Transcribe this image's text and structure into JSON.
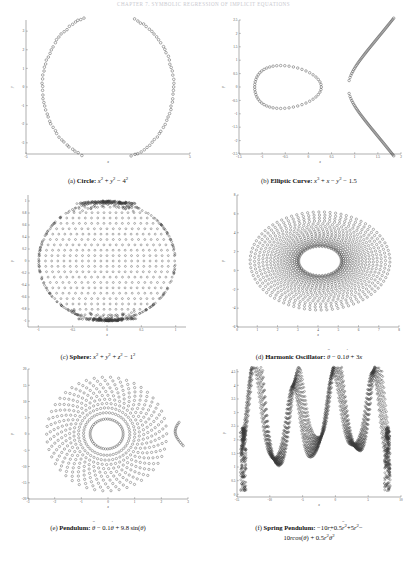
{
  "header": {
    "running_head": "CHAPTER 7. SYMBOLIC REGRESSION OF IMPLICIT EQUATIONS"
  },
  "figure": {
    "panels": [
      {
        "id": "a",
        "tag": "(a)",
        "name": "Circle",
        "equation_plain": "x^2 + y^2 - 4^2",
        "caption": "(a) Circle: x2 + y2 - 42",
        "xlabel": "x",
        "ylabel": "y"
      },
      {
        "id": "b",
        "tag": "(b)",
        "name": "Elliptic Curve",
        "equation_plain": "x^3 + x - y^2 - 1.5",
        "caption": "(b) Elliptic Curve: x3 + x - y2 - 1.5",
        "xlabel": "x",
        "ylabel": "y"
      },
      {
        "id": "c",
        "tag": "(c)",
        "name": "Sphere",
        "equation_plain": "x^2 + y^2 + z^2 - 1^2",
        "caption": "(c) Sphere: x2 + y2 + z2 - 12",
        "xlabel": "x",
        "ylabel": "y"
      },
      {
        "id": "d",
        "tag": "(d)",
        "name": "Harmonic Oscillator",
        "equation_plain": "theta-ddot - 0.1 theta-dot + 3x",
        "caption": "(d) Harmonic Oscillator: θ̈ - 0.1θ̇ + 3x",
        "xlabel": "x",
        "ylabel": "y"
      },
      {
        "id": "e",
        "tag": "(e)",
        "name": "Pendulum",
        "equation_plain": "theta-ddot - 0.1 theta-dot + 9.8 sin(theta)",
        "caption": "(e) Pendulum: θ̈ - 0.1θ̇ + 9.8 sin(θ)",
        "xlabel": "x",
        "ylabel": "y"
      },
      {
        "id": "f",
        "tag": "(f)",
        "name": "Spring Pendulum",
        "equation_plain": "-10r + 0.5 r-ddot^2 + 5r^2 - 10r cos(theta) + 0.5 r^2 theta-dot^2",
        "caption": "(f) Spring Pendulum: -10r + 0.5r̈2 + 5r2 - 10r cos(θ) + 0.5r2θ̇2",
        "xlabel": "x",
        "ylabel": "y"
      }
    ]
  },
  "style": {
    "marker_stroke": "#3a3a3a",
    "axis_color": "#7a7a7a",
    "tick_label_color": "#4a4a4a",
    "header_color": "#c9c9cf",
    "marker_radius": 1.35,
    "marker_stroke_width": 0.42
  },
  "chart_data": [
    {
      "panel": "a",
      "type": "scatter",
      "title": "Circle",
      "equation": "x^2 + y^2 - 4^2 = 0",
      "xlabel": "x",
      "ylabel": "y",
      "xlim": [
        -5,
        5
      ],
      "ylim": [
        -3.6,
        3.6
      ],
      "xticks": [
        -5,
        5
      ],
      "yticks": [
        -3,
        -2,
        -1,
        0,
        1,
        2,
        3
      ],
      "xticklabels": [
        "-5",
        "5"
      ],
      "yticklabels": [
        "-3",
        "-2",
        "-1",
        "0",
        "1",
        "2",
        "3"
      ],
      "grid": false,
      "legend": false,
      "generator": {
        "kind": "circle_ring",
        "radius": 4.0,
        "center": [
          0,
          0
        ],
        "n_points": 120,
        "noise": 0.035
      },
      "description": "Open-circle markers evenly distributed around a circle of radius 4 centred at the origin; top and bottom of the circle are clipped by the y-range so the ring appears as an arc-capped loop."
    },
    {
      "panel": "b",
      "type": "scatter",
      "title": "Elliptic Curve",
      "equation": "x^3 + x - y^2 - 1.5 = 0",
      "xlabel": "x",
      "ylabel": "y",
      "xlim": [
        -1.5,
        2
      ],
      "ylim": [
        -2.5,
        2.5
      ],
      "xticks": [
        -1.5,
        -1,
        -0.5,
        0,
        0.5,
        1,
        1.5,
        2
      ],
      "yticks": [
        -2.5,
        -2,
        -1.5,
        -1,
        -0.5,
        0,
        0.5,
        1,
        1.5,
        2,
        2.5
      ],
      "xticklabels": [
        "-1.5",
        "-1",
        "-0.5",
        "0",
        "0.5",
        "1",
        "1.5",
        "2"
      ],
      "yticklabels": [
        "-2.5",
        "-2",
        "-1.5",
        "-1",
        "-0.5",
        "0",
        "0.5",
        "1",
        "1.5",
        "2",
        "2.5"
      ],
      "grid": false,
      "legend": false,
      "generator": {
        "kind": "elliptic_curve",
        "oval_center": [
          -0.6,
          0
        ],
        "oval_rx": 0.72,
        "oval_ry": 0.8,
        "oval_points": 52,
        "branch_x_start": 0.82,
        "branch_x_end": 2.0,
        "branch_points": 60,
        "branch_curvature": 2.1
      },
      "description": "Two components: a closed egg-shaped oval spanning roughly x in [-1.3, 0.3] centred near x=-0.6, and an open rightward-opening branch starting near x=0.82 at y=0 and sweeping out to (2, +2.5) and (2, -2.5)."
    },
    {
      "panel": "c",
      "type": "scatter",
      "title": "Sphere",
      "equation": "x^2 + y^2 + z^2 - 1^2 = 0",
      "xlabel": "x",
      "ylabel": "y",
      "xlim": [
        -1.15,
        1.15
      ],
      "ylim": [
        -1.1,
        1.1
      ],
      "xticks": [
        -1,
        -0.5,
        0,
        0.5,
        1
      ],
      "yticks": [
        -1,
        -0.8,
        -0.6,
        -0.4,
        -0.2,
        0,
        0.2,
        0.4,
        0.6,
        0.8,
        1
      ],
      "xticklabels": [
        "-1",
        "-0.5",
        "0",
        "0.5",
        "1"
      ],
      "yticklabels": [
        "-1",
        "-0.8",
        "-0.6",
        "-0.4",
        "-0.2",
        "0",
        "0.2",
        "0.4",
        "0.6",
        "0.8",
        "1"
      ],
      "grid": false,
      "legend": false,
      "generator": {
        "kind": "disk_lattice",
        "radius": 1.0,
        "rows": 22,
        "cols": 22,
        "edge_density_boost": true,
        "pole_clustering": true
      },
      "description": "Projection of uniformly sampled unit-sphere points onto the xy-plane: a filled disk of radius 1 built from a regular lattice of open circles, with markedly denser clustering along the top and bottom edges (the sphere's poles in projection) and a dark rim on the left and right edges."
    },
    {
      "panel": "d",
      "type": "scatter",
      "title": "Harmonic Oscillator",
      "equation": "theta_ddot - 0.1*theta_dot + 3x = 0",
      "xlabel": "x",
      "ylabel": "y",
      "xlim": [
        0,
        8
      ],
      "ylim": [
        -6,
        8
      ],
      "xticks": [
        0,
        1,
        2,
        3,
        4,
        5,
        6,
        7,
        8
      ],
      "yticks": [
        -6,
        -4,
        -2,
        0,
        2,
        4,
        6,
        8
      ],
      "xticklabels": [
        "0",
        "1",
        "2",
        "3",
        "4",
        "5",
        "6",
        "7",
        "8"
      ],
      "yticklabels": [
        "-6",
        "-4",
        "-2",
        "0",
        "2",
        "4",
        "6",
        "8"
      ],
      "grid": false,
      "legend": false,
      "generator": {
        "kind": "spiral_rings",
        "center": [
          4.1,
          1.0
        ],
        "n_rings": 17,
        "r_min_x": 1.05,
        "r_max_x": 3.45,
        "r_min_y": 1.55,
        "r_max_y": 5.2,
        "points_per_ring": 78,
        "inner_hole": true
      },
      "description": "Phase portrait of a lightly damped harmonic oscillator: a nested family of concentric elliptical orbits centred near (4.1, 1.0), spiralling inward with a clear empty elliptical hole in the middle; ring spacing widens toward the outside."
    },
    {
      "panel": "e",
      "type": "scatter",
      "title": "Pendulum",
      "equation": "theta_ddot - 0.1*theta_dot + 9.8*sin(theta) = 0",
      "xlabel": "x",
      "ylabel": "y",
      "xlim": [
        -3,
        3
      ],
      "ylim": [
        -20,
        20
      ],
      "xticks": [
        -3,
        -2,
        -1,
        0,
        1,
        2,
        3
      ],
      "yticks": [
        -20,
        -15,
        -10,
        -5,
        0,
        5,
        10,
        15,
        20
      ],
      "xticklabels": [
        "-3",
        "-2",
        "-1",
        "0",
        "1",
        "2",
        "3"
      ],
      "yticklabels": [
        "-20",
        "-15",
        "-10",
        "-5",
        "0",
        "5",
        "10",
        "15",
        "20"
      ],
      "grid": false,
      "legend": false,
      "generator": {
        "kind": "radial_spokes",
        "center": [
          -0.05,
          0.0
        ],
        "n_spokes": 46,
        "points_per_spoke": 11,
        "r_inner_x": 0.62,
        "r_outer_x": 2.25,
        "r_inner_y": 4.6,
        "r_outer_y": 17.5,
        "twist": 0.55,
        "tail": true
      },
      "description": "Pendulum phase portrait rendered as a sunburst: ~46 curved radial spokes of open circles emanating from an empty oval core centred at the origin out to the plot edges, with a short isolated hook of points near (2.8, -2)."
    },
    {
      "panel": "f",
      "type": "scatter",
      "title": "Spring Pendulum",
      "equation": "-10r + 0.5*r_ddot^2 + 5r^2 - 10r*cos(theta) + 0.5*r^2*theta_dot^2 = 0",
      "xlabel": "x",
      "ylabel": "y",
      "xlim": [
        -15,
        10
      ],
      "ylim": [
        -0.1,
        4.6
      ],
      "xticks": [
        -15,
        -10,
        -5,
        0,
        5,
        10
      ],
      "yticks": [
        0,
        0.5,
        1,
        1.5,
        2,
        2.5,
        3,
        3.5,
        4,
        4.5
      ],
      "xticklabels": [
        "-15",
        "-10",
        "-5",
        "0",
        "5",
        "10"
      ],
      "yticklabels": [
        "0",
        "0.5",
        "1",
        "1.5",
        "2",
        "2.5",
        "3",
        "3.5",
        "4",
        "4.5"
      ],
      "grid": false,
      "legend": false,
      "generator": {
        "kind": "spring_pendulum_wave",
        "peaks_x": [
          -12.2,
          -6.1,
          0.0,
          6.1
        ],
        "peak_heights": [
          4.3,
          3.8,
          3.8,
          4.3
        ],
        "trough_heights": [
          0.15,
          0.95,
          0.15
        ],
        "baseline": 2.15,
        "n_traces": 9,
        "samples": 260,
        "shoulder_x": [
          -14.0,
          7.9
        ]
      },
      "description": "Dense overlaid trajectories of a spring pendulum forming a repeating wave: four tall narrow spikes at x ≈ -12.2, -6.1, 0 and 6.1 reaching y ≈ 4.3, 3.8, 3.8 and 4.3, separated by deep troughs near y ≈ 0.15 with a shallower central trough at y ≈ 0.95; vertical banded shoulders of scattered points rise near x ≈ -14 and x ≈ 8."
    }
  ]
}
